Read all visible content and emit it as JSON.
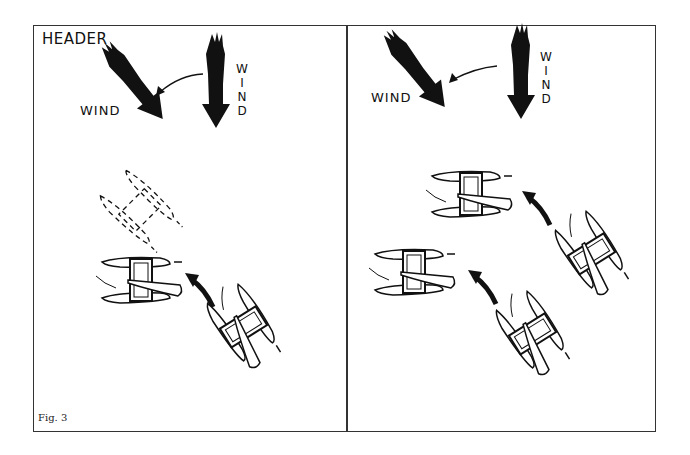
{
  "figure": {
    "caption": "Fig. 3",
    "panels": [
      {
        "id": "left",
        "title": "HEADER",
        "wind_labels": [
          "WIND",
          "WIND"
        ],
        "description": "Wind shift (header) from north to northwest; catamaran tacks from starboard angle to new heading, dashed outline showing previous heading"
      },
      {
        "id": "right",
        "title": "",
        "wind_labels": [
          "WIND",
          "WIND"
        ],
        "description": "Two catamarans tacking onto new heading after wind shift"
      }
    ]
  },
  "colors": {
    "ink": "#111111",
    "border": "#333333",
    "background": "#ffffff"
  }
}
